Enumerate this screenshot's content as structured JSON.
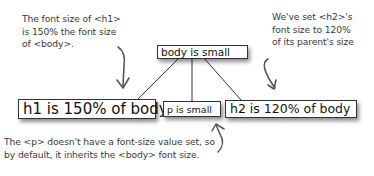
{
  "annotations": {
    "h1_note": [
      "The font size of <h1>",
      "is 150% the font size",
      "of <body>."
    ],
    "h2_note": [
      "We've set <h2>'s",
      "font size to 120%",
      "of its parent's size"
    ],
    "p_note": [
      "The <p> doesn't have a font-size value set, so",
      "by default, it inherits the <body> font size."
    ]
  },
  "tree": {
    "root": {
      "label": "body is small"
    },
    "children": [
      {
        "label": "h1 is 150% of body"
      },
      {
        "label": "p is small"
      },
      {
        "label": "h2 is 120% of body"
      }
    ]
  },
  "colors": {
    "line": "#333333",
    "text": "#3a3a3a",
    "box_border": "#333333"
  }
}
